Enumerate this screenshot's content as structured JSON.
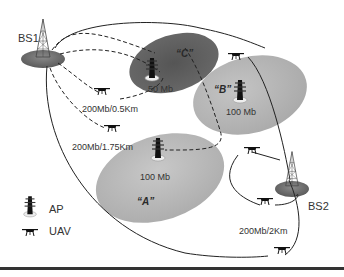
{
  "diagram": {
    "type": "network topology",
    "base_stations": [
      {
        "id": "BS1",
        "label": "BS1"
      },
      {
        "id": "BS2",
        "label": "BS2"
      }
    ],
    "access_points": [
      {
        "id": "C",
        "zone_label": "“C”",
        "capacity": "50 Mb"
      },
      {
        "id": "B",
        "zone_label": "“B”",
        "capacity": "100 Mb"
      },
      {
        "id": "A",
        "zone_label": "“A”",
        "capacity": "100 Mb"
      }
    ],
    "links": [
      {
        "label": "200Mb/0.5Km"
      },
      {
        "label": "200Mb/1.75Km"
      },
      {
        "label": "200Mb/2Km"
      }
    ],
    "legend": [
      {
        "icon": "access-point-icon",
        "label": "AP"
      },
      {
        "icon": "uav-icon",
        "label": "UAV"
      }
    ],
    "colors": {
      "zone_c": "#5e5e5e",
      "zone_b": "#b5b5b5",
      "zone_a": "#b8b8b8",
      "bs_base": "#7a7a7a",
      "line": "#222222"
    }
  }
}
